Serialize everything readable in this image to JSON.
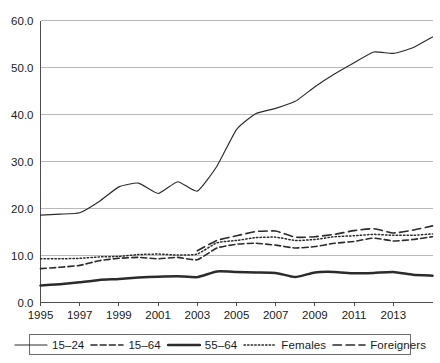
{
  "chart_data": {
    "type": "line",
    "title": "",
    "xlabel": "",
    "ylabel": "",
    "xlim": [
      1995,
      2015
    ],
    "ylim": [
      0.0,
      60.0
    ],
    "grid": true,
    "legend_position": "bottom",
    "x": [
      1995,
      1996,
      1997,
      1998,
      1999,
      2000,
      2001,
      2002,
      2003,
      2004,
      2005,
      2006,
      2007,
      2008,
      2009,
      2010,
      2011,
      2012,
      2013,
      2014,
      2015
    ],
    "xticks": [
      "1995",
      "1997",
      "1999",
      "2001",
      "2003",
      "2005",
      "2007",
      "2009",
      "2011",
      "2013"
    ],
    "xtick_values": [
      1995,
      1997,
      1999,
      2001,
      2003,
      2005,
      2007,
      2009,
      2011,
      2013
    ],
    "yticks": [
      "0.0",
      "10.0",
      "20.0",
      "30.0",
      "40.0",
      "50.0",
      "60.0"
    ],
    "ytick_values": [
      0.0,
      10.0,
      20.0,
      30.0,
      40.0,
      50.0,
      60.0
    ],
    "series": [
      {
        "name": "15–24",
        "style": "solid-thin",
        "values": [
          18.6,
          18.8,
          19.1,
          21.5,
          24.6,
          25.4,
          23.2,
          25.7,
          23.7,
          29.0,
          36.8,
          40.2,
          41.3,
          42.8,
          45.9,
          48.6,
          51.0,
          53.3,
          53.0,
          54.2,
          56.5
        ]
      },
      {
        "name": "15–64",
        "style": "dashed",
        "values": [
          7.2,
          7.5,
          7.9,
          8.9,
          9.4,
          9.6,
          9.3,
          9.6,
          9.1,
          11.6,
          12.4,
          12.6,
          12.2,
          11.6,
          11.9,
          12.6,
          13.0,
          13.7,
          13.1,
          13.4,
          14.0
        ]
      },
      {
        "name": "55–64",
        "style": "solid-thick",
        "values": [
          3.6,
          3.9,
          4.3,
          4.8,
          5.0,
          5.3,
          5.5,
          5.6,
          5.4,
          6.6,
          6.5,
          6.4,
          6.3,
          5.4,
          6.4,
          6.5,
          6.2,
          6.3,
          6.5,
          5.9,
          5.7
        ]
      },
      {
        "name": "Females",
        "style": "dotted",
        "values": [
          9.3,
          9.3,
          9.4,
          9.7,
          9.8,
          10.2,
          10.3,
          10.1,
          10.3,
          12.7,
          13.2,
          13.8,
          13.9,
          13.2,
          13.4,
          14.0,
          14.2,
          14.5,
          14.3,
          14.3,
          14.6
        ]
      },
      {
        "name": "Foreigners",
        "style": "long-dash",
        "values": [
          null,
          null,
          null,
          null,
          null,
          null,
          null,
          null,
          11.0,
          13.2,
          14.2,
          15.1,
          15.2,
          13.9,
          14.0,
          14.5,
          15.3,
          15.7,
          14.8,
          15.4,
          16.3
        ]
      }
    ]
  },
  "legend": {
    "items": [
      {
        "label": "15–24",
        "style": "solid-thin"
      },
      {
        "label": "15–64",
        "style": "dashed"
      },
      {
        "label": "55–64",
        "style": "solid-thick"
      },
      {
        "label": "Females",
        "style": "dotted"
      },
      {
        "label": "Foreigners",
        "style": "long-dash"
      }
    ]
  }
}
